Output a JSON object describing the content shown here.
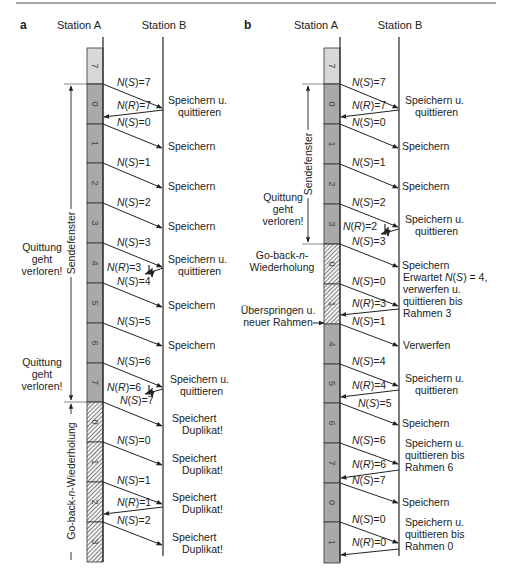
{
  "topRuleColor": "#8a8a8a",
  "colors": {
    "windowFill": "#a9a9a9",
    "idleFill": "#d8d8d8",
    "lineColor": "#222222",
    "hatchColor": "#333333"
  },
  "panels": [
    {
      "id": "a",
      "label": "a",
      "stationA": "Station A",
      "stationB": "Station B",
      "geom": {
        "barX": 87,
        "barW": 16,
        "lineAx": 103,
        "lineBx": 163,
        "topY": 37,
        "bottomY": 562
      },
      "frames": [
        {
          "num": "7",
          "y0": 48,
          "y1": 84,
          "style": "idle"
        },
        {
          "num": "0",
          "y0": 84,
          "y1": 124,
          "style": "window"
        },
        {
          "num": "1",
          "y0": 124,
          "y1": 163,
          "style": "window"
        },
        {
          "num": "2",
          "y0": 163,
          "y1": 203,
          "style": "window"
        },
        {
          "num": "3",
          "y0": 203,
          "y1": 243,
          "style": "window"
        },
        {
          "num": "4",
          "y0": 243,
          "y1": 283,
          "style": "window"
        },
        {
          "num": "5",
          "y0": 283,
          "y1": 323,
          "style": "window"
        },
        {
          "num": "6",
          "y0": 323,
          "y1": 363,
          "style": "window"
        },
        {
          "num": "7",
          "y0": 363,
          "y1": 402,
          "style": "window"
        },
        {
          "num": "0",
          "y0": 402,
          "y1": 442,
          "style": "hatched"
        },
        {
          "num": "1",
          "y0": 442,
          "y1": 482,
          "style": "hatched"
        },
        {
          "num": "2",
          "y0": 482,
          "y1": 522,
          "style": "hatched"
        },
        {
          "num": "3",
          "y0": 522,
          "y1": 562,
          "style": "hatched"
        }
      ],
      "messages": [
        {
          "dir": "AB",
          "label": "N(S)=7",
          "y0": 84,
          "y1": 108,
          "lx": 117,
          "ly": 86
        },
        {
          "dir": "BA",
          "label": "N(R)=7",
          "y0": 110,
          "y1": 117,
          "lx": 117,
          "ly": 109
        },
        {
          "dir": "AB",
          "label": "N(S)=0",
          "y0": 124,
          "y1": 148,
          "lx": 117,
          "ly": 126
        },
        {
          "dir": "AB",
          "label": "N(S)=1",
          "y0": 163,
          "y1": 188,
          "lx": 117,
          "ly": 166
        },
        {
          "dir": "AB",
          "label": "N(S)=2",
          "y0": 203,
          "y1": 228,
          "lx": 117,
          "ly": 206
        },
        {
          "dir": "AB",
          "label": "N(S)=3",
          "y0": 243,
          "y1": 267,
          "lx": 117,
          "ly": 246
        },
        {
          "dir": "BA_LOST",
          "label": "N(R)=3",
          "y0": 268,
          "y1": 272,
          "lx": 107,
          "ly": 271
        },
        {
          "dir": "AB",
          "label": "N(S)=4",
          "y0": 283,
          "y1": 307,
          "lx": 117,
          "ly": 285
        },
        {
          "dir": "AB",
          "label": "N(S)=5",
          "y0": 323,
          "y1": 346,
          "lx": 117,
          "ly": 325
        },
        {
          "dir": "AB",
          "label": "N(S)=6",
          "y0": 363,
          "y1": 387,
          "lx": 117,
          "ly": 365
        },
        {
          "dir": "BA_LOST",
          "label": "N(R)=6",
          "y0": 389,
          "y1": 392,
          "lx": 107,
          "ly": 391
        },
        {
          "dir": "AB",
          "label": "N(S)=7",
          "y0": 402,
          "y1": 426,
          "lx": 120,
          "ly": 404
        },
        {
          "dir": "AB",
          "label": "N(S)=0",
          "y0": 442,
          "y1": 465,
          "lx": 117,
          "ly": 444
        },
        {
          "dir": "AB",
          "label": "N(S)=1",
          "y0": 482,
          "y1": 504,
          "lx": 117,
          "ly": 484
        },
        {
          "dir": "BA",
          "label": "N(R)=1",
          "y0": 507,
          "y1": 514,
          "lx": 117,
          "ly": 506
        },
        {
          "dir": "AB",
          "label": "N(S)=2",
          "y0": 522,
          "y1": 545,
          "lx": 117,
          "ly": 524
        }
      ],
      "bActions": [
        {
          "lines": [
            "Speichern u.",
            "quittieren"
          ],
          "x": 168,
          "y": 107
        },
        {
          "lines": [
            "Speichern"
          ],
          "x": 168,
          "y": 147
        },
        {
          "lines": [
            "Speichern"
          ],
          "x": 168,
          "y": 187
        },
        {
          "lines": [
            "Speichern"
          ],
          "x": 168,
          "y": 227
        },
        {
          "lines": [
            "Speichern u.",
            "quittieren"
          ],
          "x": 168,
          "y": 266
        },
        {
          "lines": [
            "Speichern"
          ],
          "x": 168,
          "y": 306
        },
        {
          "lines": [
            "Speichern"
          ],
          "x": 168,
          "y": 346
        },
        {
          "lines": [
            "Speichern u.",
            "quittieren"
          ],
          "x": 170,
          "y": 386
        },
        {
          "lines": [
            "Speichert",
            "Duplikat!"
          ],
          "x": 172,
          "y": 425
        },
        {
          "lines": [
            "Speichert",
            "Duplikat!"
          ],
          "x": 172,
          "y": 465
        },
        {
          "lines": [
            "Speichert",
            "Duplikat!"
          ],
          "x": 172,
          "y": 504
        },
        {
          "lines": [
            "Speichert",
            "Duplikat!"
          ],
          "x": 172,
          "y": 544
        }
      ],
      "sideNotes": [
        {
          "lines": [
            "Quittung",
            "geht",
            "verloren!"
          ],
          "x": 42,
          "y": 260
        },
        {
          "lines": [
            "Quittung",
            "geht",
            "verloren!"
          ],
          "x": 42,
          "y": 375
        }
      ],
      "windowBracket": {
        "x": 71,
        "y0": 84,
        "y1": 402,
        "label": "Sendefenster",
        "tickX0": 64,
        "tickX1": 87
      },
      "gbnBracket": {
        "x": 71,
        "y0": 402,
        "y1": 560,
        "label": "Go-back-n-Wiederholung"
      }
    },
    {
      "id": "b",
      "label": "b",
      "stationA": "Station A",
      "stationB": "Station B",
      "geom": {
        "barX": 324,
        "barW": 16,
        "lineAx": 340,
        "lineBx": 399,
        "topY": 37,
        "bottomY": 562
      },
      "frames": [
        {
          "num": "7",
          "y0": 48,
          "y1": 84,
          "style": "idle"
        },
        {
          "num": "0",
          "y0": 84,
          "y1": 124,
          "style": "window"
        },
        {
          "num": "1",
          "y0": 124,
          "y1": 164,
          "style": "window"
        },
        {
          "num": "2",
          "y0": 164,
          "y1": 204,
          "style": "window"
        },
        {
          "num": "3",
          "y0": 204,
          "y1": 244,
          "style": "window"
        },
        {
          "num": "0",
          "y0": 244,
          "y1": 284,
          "style": "hatched"
        },
        {
          "num": "1",
          "y0": 284,
          "y1": 324,
          "style": "hatched"
        },
        {
          "num": "4",
          "y0": 324,
          "y1": 364,
          "style": "window"
        },
        {
          "num": "5",
          "y0": 364,
          "y1": 403,
          "style": "window"
        },
        {
          "num": "6",
          "y0": 403,
          "y1": 443,
          "style": "window"
        },
        {
          "num": "7",
          "y0": 443,
          "y1": 483,
          "style": "window"
        },
        {
          "num": "0",
          "y0": 483,
          "y1": 522,
          "style": "window"
        },
        {
          "num": "1",
          "y0": 522,
          "y1": 563,
          "style": "window"
        }
      ],
      "messages": [
        {
          "dir": "AB",
          "label": "N(S)=7",
          "y0": 84,
          "y1": 108,
          "lx": 352,
          "ly": 86
        },
        {
          "dir": "BA",
          "label": "N(R)=7",
          "y0": 110,
          "y1": 117,
          "lx": 352,
          "ly": 109
        },
        {
          "dir": "AB",
          "label": "N(S)=0",
          "y0": 124,
          "y1": 148,
          "lx": 352,
          "ly": 126
        },
        {
          "dir": "AB",
          "label": "N(S)=1",
          "y0": 164,
          "y1": 188,
          "lx": 352,
          "ly": 166
        },
        {
          "dir": "AB",
          "label": "N(S)=2",
          "y0": 204,
          "y1": 227,
          "lx": 352,
          "ly": 206
        },
        {
          "dir": "BA_LOST",
          "label": "N(R)=2",
          "y0": 229,
          "y1": 232,
          "lx": 343,
          "ly": 230
        },
        {
          "dir": "AB",
          "label": "N(S)=3",
          "y0": 244,
          "y1": 267,
          "lx": 352,
          "ly": 245
        },
        {
          "dir": "AB",
          "label": "N(S)=0",
          "y0": 284,
          "y1": 306,
          "lx": 352,
          "ly": 285
        },
        {
          "dir": "BA",
          "label": "N(R)=3",
          "y0": 309,
          "y1": 315,
          "lx": 352,
          "ly": 307
        },
        {
          "dir": "AB",
          "label": "N(S)=1",
          "y0": 324,
          "y1": 346,
          "lx": 352,
          "ly": 325
        },
        {
          "dir": "AB",
          "label": "N(S)=4",
          "y0": 364,
          "y1": 386,
          "lx": 352,
          "ly": 365
        },
        {
          "dir": "BA",
          "label": "N(R)=4",
          "y0": 390,
          "y1": 397,
          "lx": 352,
          "ly": 389
        },
        {
          "dir": "AB",
          "label": "N(S)=5",
          "y0": 403,
          "y1": 425,
          "lx": 358,
          "ly": 407
        },
        {
          "dir": "AB",
          "label": "N(S)=6",
          "y0": 443,
          "y1": 464,
          "lx": 352,
          "ly": 444
        },
        {
          "dir": "BA",
          "label": "N(R)=6",
          "y0": 470,
          "y1": 478,
          "lx": 352,
          "ly": 468
        },
        {
          "dir": "AB",
          "label": "N(S)=7",
          "y0": 483,
          "y1": 503,
          "lx": 352,
          "ly": 484
        },
        {
          "dir": "AB",
          "label": "N(S)=0",
          "y0": 522,
          "y1": 543,
          "lx": 352,
          "ly": 523
        },
        {
          "dir": "BA",
          "label": "N(R)=0",
          "y0": 549,
          "y1": 555,
          "lx": 352,
          "ly": 546
        }
      ],
      "bActions": [
        {
          "lines": [
            "Speichern u.",
            "quittieren"
          ],
          "x": 405,
          "y": 107
        },
        {
          "lines": [
            "Speichern"
          ],
          "x": 402,
          "y": 147
        },
        {
          "lines": [
            "Speichern"
          ],
          "x": 402,
          "y": 187
        },
        {
          "lines": [
            "Speichern u.",
            "quittieren"
          ],
          "x": 405,
          "y": 226
        },
        {
          "lines": [
            "Speichern"
          ],
          "x": 402,
          "y": 266
        },
        {
          "lines": [
            "Erwartet N(S) = 4,",
            "verwerfen u.",
            "quittieren bis",
            "Rahmen 3"
          ],
          "x": 403,
          "y": 296
        },
        {
          "lines": [
            "Verwerfen"
          ],
          "x": 403,
          "y": 346
        },
        {
          "lines": [
            "Speichern u.",
            "quittieren"
          ],
          "x": 405,
          "y": 385
        },
        {
          "lines": [
            "Speichern"
          ],
          "x": 402,
          "y": 424
        },
        {
          "lines": [
            "Speichern u.",
            "quittieren bis",
            "Rahmen 6"
          ],
          "x": 405,
          "y": 456
        },
        {
          "lines": [
            "Speichern"
          ],
          "x": 402,
          "y": 503
        },
        {
          "lines": [
            "Speichern u.",
            "quittieren bis",
            "Rahmen 0"
          ],
          "x": 405,
          "y": 535
        }
      ],
      "sideNotes": [
        {
          "lines": [
            "Quittung",
            "geht",
            "verloren!"
          ],
          "x": 283,
          "y": 210
        },
        {
          "lines": [
            "Go-back-n-",
            "Wiederholung"
          ],
          "x": 282,
          "y": 262
        },
        {
          "lines": [
            "Überspringen u.",
            "neuer Rahmen"
          ],
          "x": 278,
          "y": 317
        }
      ],
      "windowBracket": {
        "x": 308,
        "y0": 84,
        "y1": 244,
        "label": "Sendefenster",
        "tickX0": 302,
        "tickX1": 324
      },
      "skipArrow": {
        "x0": 313,
        "x1": 324,
        "y": 323
      }
    }
  ]
}
